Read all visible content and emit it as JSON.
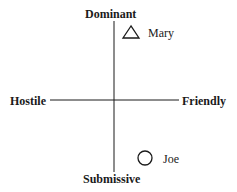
{
  "axes": {
    "top": "Dominant",
    "bottom": "Submissive",
    "left": "Hostile",
    "right": "Friendly"
  },
  "points": [
    {
      "label": "Mary",
      "shape": "triangle",
      "quadrant": "dominant-friendly"
    },
    {
      "label": "Joe",
      "shape": "circle",
      "quadrant": "submissive-friendly"
    }
  ],
  "colors": {
    "ink": "#1a1a1a",
    "background": "#ffffff"
  }
}
